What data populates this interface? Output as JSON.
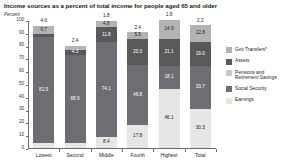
{
  "chart_data": {
    "type": "bar",
    "title": "Income sources as a percent of total income for people aged 65 and older",
    "subtype": "stacked-bar-100pct",
    "ylabel": "Percent",
    "xlabel": "",
    "ylim": [
      0,
      100
    ],
    "yticks": [
      0,
      10,
      20,
      30,
      40,
      50,
      60,
      70,
      80,
      90,
      100
    ],
    "grid": false,
    "legend_position": "right",
    "categories": [
      "Lowest",
      "Second",
      "Middle",
      "Fourth",
      "Highest",
      "Total"
    ],
    "series": [
      {
        "name": "Gov Transfers*",
        "color": "#b3b3b3",
        "values": [
          6.7,
          3.1,
          4.8,
          5.5,
          14.9,
          12.8
        ],
        "labels": [
          "6.7",
          "3.1",
          "4.8",
          "5.5",
          "14.9",
          "12.8"
        ]
      },
      {
        "name": "Assets",
        "color": "#58595b",
        "values": [
          2.2,
          4.3,
          11.8,
          20.3,
          21.1,
          19.0
        ],
        "labels": [
          "2.2",
          "4.3",
          "11.8",
          "20.3",
          "21.1",
          "19.0"
        ]
      },
      {
        "name": "Pensions and Retirement Savings",
        "color": "#c8c8c8",
        "values": [
          4.6,
          2.4,
          1.8,
          2.4,
          1.8,
          2.2
        ],
        "labels": [
          "4.6",
          "2.4",
          "1.8",
          "2.4",
          "1.8",
          "2.2"
        ],
        "label_position": "above-bar"
      },
      {
        "name": "Social Security",
        "color": "#6d6e71",
        "values": [
          82.9,
          68.9,
          74.1,
          46.8,
          18.1,
          33.7
        ],
        "labels": [
          "82.9",
          "68.9",
          "74.1",
          "46.8",
          "18.1",
          "33.7"
        ]
      },
      {
        "name": "Earnings",
        "color": "#e6e6e6",
        "values": [
          3.6,
          3.6,
          8.4,
          17.8,
          46.1,
          30.3
        ],
        "labels": [
          "3.6",
          "3.6",
          "8.4",
          "17.8",
          "46.1",
          "30.3"
        ]
      }
    ],
    "top_annotations": [
      "4.6",
      "2.4",
      "1.8",
      "2.4",
      "1.8",
      "2.2"
    ],
    "colors": {
      "gov_transfers": "#b3b3b3",
      "assets": "#58595b",
      "pensions": "#c8c8c8",
      "social_security": "#6d6e71",
      "earnings": "#e6e6e6",
      "axis": "#6d6e71",
      "text": "#231f20"
    }
  },
  "legend": {
    "items": [
      {
        "label": "Gov Transfers*",
        "color": "#b3b3b3"
      },
      {
        "label": "Assets",
        "color": "#58595b"
      },
      {
        "label": "Pensions and\nRetirement Savings",
        "color": "#c8c8c8"
      },
      {
        "label": "Social Security",
        "color": "#6d6e71"
      },
      {
        "label": "Earnings",
        "color": "#e6e6e6"
      }
    ]
  }
}
